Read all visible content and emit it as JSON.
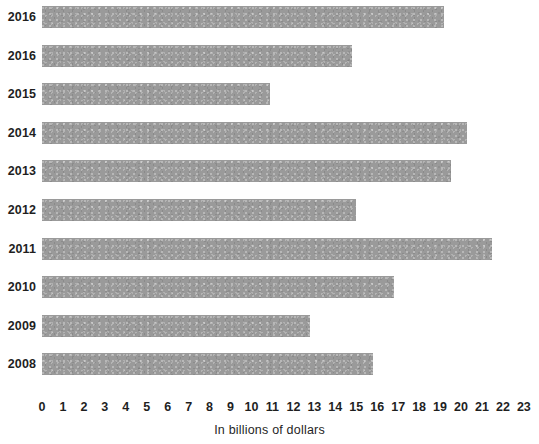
{
  "chart_data": {
    "type": "bar",
    "orientation": "horizontal",
    "title": "",
    "subtitle": "",
    "xlabel": "In billions of dollars",
    "ylabel": "",
    "categories": [
      "2016",
      "2016",
      "2015",
      "2014",
      "2013",
      "2012",
      "2011",
      "2010",
      "2009",
      "2008"
    ],
    "values": [
      19.2,
      14.8,
      10.9,
      20.3,
      19.5,
      15.0,
      21.5,
      16.8,
      12.8,
      15.8
    ],
    "series": [
      {
        "name": "",
        "values": [
          19.2,
          14.8,
          10.9,
          20.3,
          19.5,
          15.0,
          21.5,
          16.8,
          12.8,
          15.8
        ]
      }
    ],
    "xlim": [
      0,
      23
    ],
    "xticks": [
      0,
      1,
      2,
      3,
      4,
      5,
      6,
      7,
      8,
      9,
      10,
      11,
      12,
      13,
      14,
      15,
      16,
      17,
      18,
      19,
      20,
      21,
      22,
      23
    ],
    "xtick_labels": [
      "0",
      "1",
      "2",
      "3",
      "4",
      "5",
      "6",
      "7",
      "8",
      "9",
      "10",
      "11",
      "12",
      "13",
      "14",
      "15",
      "16",
      "17",
      "18",
      "19",
      "20",
      "21",
      "22",
      "23"
    ],
    "grid": false,
    "legend": false,
    "legend_position": "none",
    "bar_color": "#9a9a9a",
    "background_color": "#ffffff",
    "text_color": "#1f1f1f"
  },
  "axis": {
    "x_title": "In billions of dollars"
  }
}
